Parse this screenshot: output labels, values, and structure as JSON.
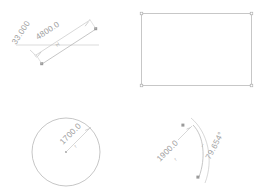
{
  "canvas": {
    "width": 267,
    "height": 191,
    "background": "#ffffff",
    "geometry_color": "#b7b7b7",
    "dimension_color": "#bdbdbd",
    "text_color": "#a0a0a0"
  },
  "figures": [
    {
      "id": "line-figure",
      "name": "dimensioned-line",
      "shape": "line",
      "dimensions": [
        {
          "name": "length-dimension",
          "type": "linear",
          "value": "4800.0",
          "symbol": "H"
        },
        {
          "name": "angle-dimension",
          "type": "angular",
          "value": "33.000",
          "symbol": ""
        }
      ]
    },
    {
      "id": "rect-figure",
      "name": "rectangle",
      "shape": "rectangle",
      "dimensions": []
    },
    {
      "id": "circle-figure",
      "name": "dimensioned-circle",
      "shape": "circle",
      "dimensions": [
        {
          "name": "radius-dimension",
          "type": "radial",
          "value": "1700.0",
          "symbol": "r"
        }
      ]
    },
    {
      "id": "arc-figure",
      "name": "dimensioned-arc",
      "shape": "arc",
      "dimensions": [
        {
          "name": "radius-dimension",
          "type": "radial",
          "value": "1900.0",
          "symbol": "r"
        },
        {
          "name": "angle-dimension",
          "type": "angular",
          "value": "79.654°",
          "symbol": ""
        }
      ]
    }
  ],
  "labels": {
    "line_length": "4800.0",
    "line_length_symbol": "H",
    "line_angle": "33.000",
    "circle_radius": "1700.0",
    "circle_radius_symbol": "r",
    "arc_radius": "1900.0",
    "arc_radius_symbol": "r",
    "arc_angle": "79.654°",
    "arc_angle_symbol": "↔"
  }
}
